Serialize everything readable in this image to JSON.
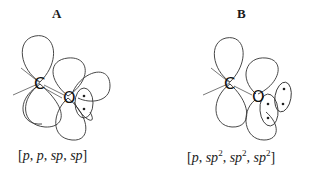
{
  "panels": [
    {
      "id": "A",
      "label": "A",
      "atoms": [
        "C",
        "O"
      ],
      "caption": {
        "open": "[",
        "parts": [
          "p",
          ", ",
          "p",
          ", ",
          "sp",
          ", ",
          "sp"
        ],
        "close": "]"
      },
      "caption_text": "[p, p, sp, sp]",
      "lone_pairs": 1
    },
    {
      "id": "B",
      "label": "B",
      "atoms": [
        "C",
        "O"
      ],
      "caption": {
        "open": "[",
        "parts": [
          "p",
          ", ",
          "sp",
          "2",
          ", ",
          "sp",
          "2",
          ", ",
          "sp",
          "2"
        ],
        "close": "]"
      },
      "caption_text": "[p, sp2, sp2, sp2]",
      "lone_pairs": 2
    }
  ],
  "colors": {
    "line": "#333333",
    "text": "#1a1a1a",
    "background": "#ffffff"
  }
}
